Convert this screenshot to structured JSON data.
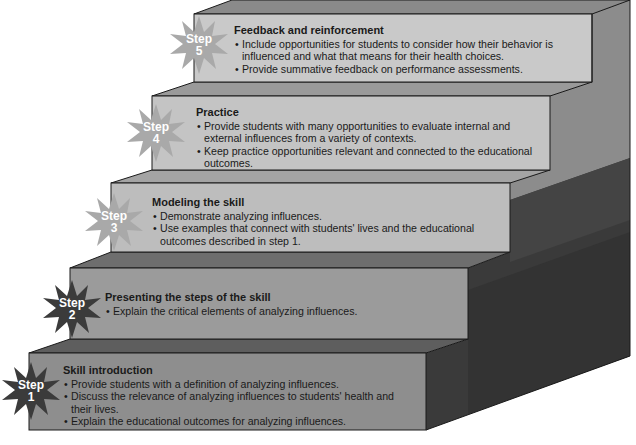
{
  "diagram": {
    "type": "staircase",
    "colors": {
      "front_faces": [
        "#8e8e8e",
        "#9b9b9b",
        "#bdbdbd",
        "#c4c4c4",
        "#c9c9c9"
      ],
      "badge_light": "#a9a9a9",
      "badge_dark": "#3b3b3b",
      "side_dark": "#3a3a3a",
      "side_light": "#8a8a8a"
    },
    "steps": [
      {
        "badge_word": "Step",
        "number": "1",
        "title": "Skill introduction",
        "bullets": [
          "Provide students with a definition of analyzing influences.",
          "Discuss the relevance of analyzing influences to students' health and their lives.",
          "Explain the educational outcomes for analyzing influences."
        ]
      },
      {
        "badge_word": "Step",
        "number": "2",
        "title": "Presenting the steps of the skill",
        "bullets": [
          "Explain the critical elements of analyzing influences."
        ]
      },
      {
        "badge_word": "Step",
        "number": "3",
        "title": "Modeling the skill",
        "bullets": [
          "Demonstrate analyzing influences.",
          "Use examples that connect with students' lives and the educational outcomes described in step 1."
        ]
      },
      {
        "badge_word": "Step",
        "number": "4",
        "title": "Practice",
        "bullets": [
          "Provide students with many opportunities to evaluate internal and external influences from a variety of contexts.",
          "Keep practice opportunities relevant and connected to the educational outcomes."
        ]
      },
      {
        "badge_word": "Step",
        "number": "5",
        "title": "Feedback and reinforcement",
        "bullets": [
          "Include opportunities for students to consider how their behavior is influenced and what that means for their health choices.",
          "Provide summative feedback on performance assessments."
        ]
      }
    ]
  }
}
